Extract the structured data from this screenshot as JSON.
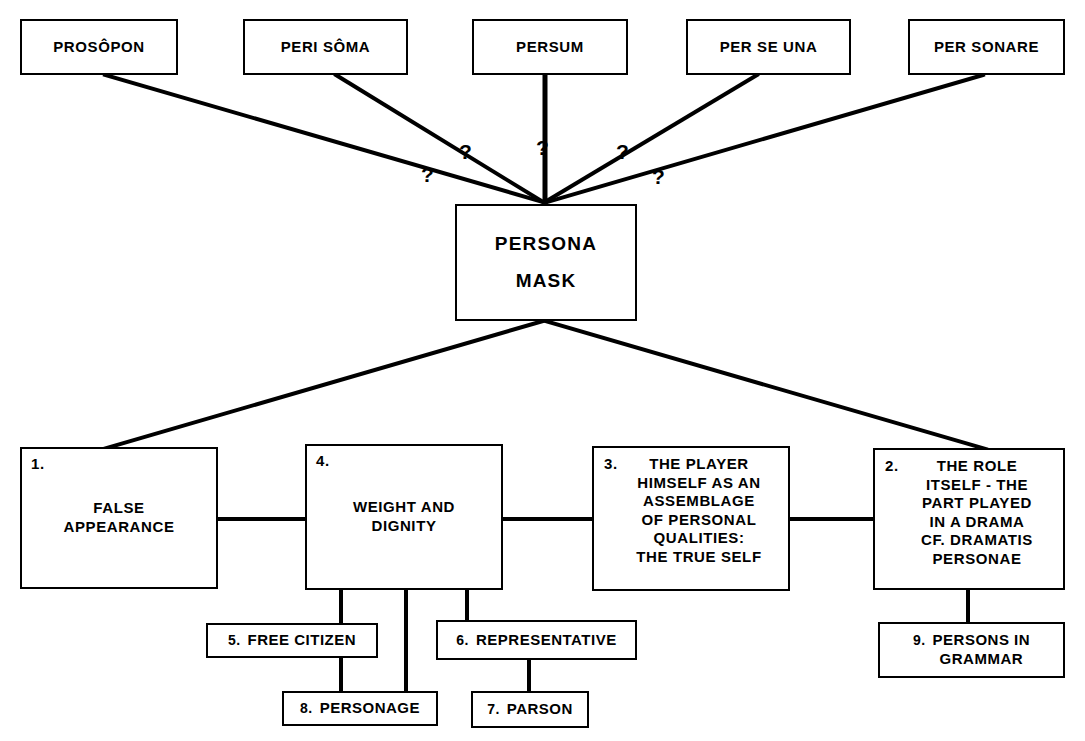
{
  "diagram": {
    "line_color": "#000000",
    "background": "#ffffff"
  },
  "hub": {
    "line1": "PERSONA",
    "line2": "MASK",
    "text": "PERSONA\nMASK"
  },
  "etymologies": [
    {
      "id": "prosopon",
      "label": "PROSÔPON",
      "bold": false
    },
    {
      "id": "peri-soma",
      "label": "PERI SÔMA",
      "bold": false
    },
    {
      "id": "persum",
      "label": "PERSUM",
      "bold": false
    },
    {
      "id": "per-se-una",
      "label": "PER SE UNA",
      "bold": false
    },
    {
      "id": "per-sonare",
      "label": "PER SONARE",
      "bold": true
    }
  ],
  "question_marks": [
    "?",
    "?",
    "?",
    "?",
    "?"
  ],
  "senses": [
    {
      "id": "false-appearance",
      "number": "1.",
      "text": "FALSE\nAPPEARANCE",
      "bold": false
    },
    {
      "id": "weight-and-dignity",
      "number": "4.",
      "text": "WEIGHT AND\nDIGNITY",
      "bold": false
    },
    {
      "id": "true-self",
      "number": "3.",
      "text": "THE PLAYER\nHIMSELF AS AN\nASSEMBLAGE\nOF PERSONAL\nQUALITIES:\nTHE TRUE SELF",
      "bold": false
    },
    {
      "id": "the-role-itself",
      "number": "2.",
      "text": "THE ROLE\nITSELF - THE\nPART PLAYED\nIN A DRAMA\nCF. DRAMATIS\nPERSONAE",
      "bold": true
    }
  ],
  "leaves": [
    {
      "id": "free-citizen",
      "number": "5.",
      "label": "FREE CITIZEN",
      "bold": false
    },
    {
      "id": "personage",
      "number": "8.",
      "label": "PERSONAGE",
      "bold": false
    },
    {
      "id": "representative",
      "number": "6.",
      "label": "REPRESENTATIVE",
      "bold": false
    },
    {
      "id": "parson",
      "number": "7.",
      "label": "PARSON",
      "bold": false
    },
    {
      "id": "persons-grammar",
      "number": "9.",
      "label": "PERSONS IN\nGRAMMAR",
      "bold": true
    }
  ]
}
